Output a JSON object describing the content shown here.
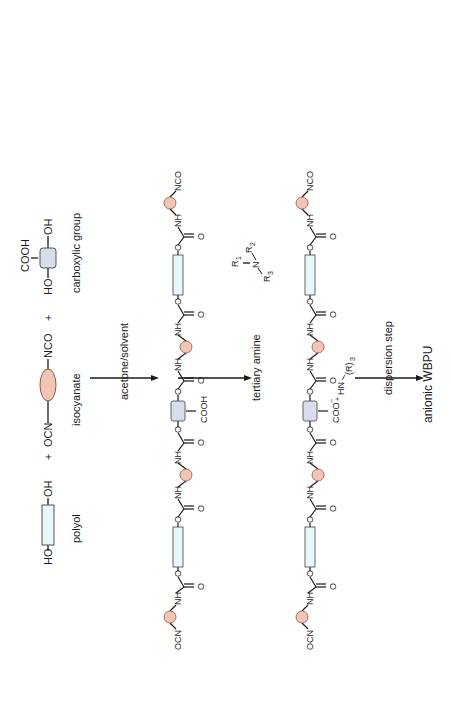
{
  "reactants": {
    "polyol": {
      "left": "HO",
      "right": "OH",
      "label": "polyol"
    },
    "plus1": "+",
    "isocyanate": {
      "left": "OCN",
      "right": "NCO",
      "label": "isocyanate"
    },
    "plus2": "+",
    "carboxylic": {
      "left": "HO",
      "right": "OH",
      "top": "COOH",
      "label": "carboxylic group"
    }
  },
  "steps": [
    {
      "label": "acetone/solvent"
    },
    {
      "label": "tertiary amine",
      "amine": {
        "r1": "R",
        "r1_sub": "1",
        "n": "N",
        "r2": "R",
        "r2_sub": "2",
        "r3": "R",
        "r3_sub": "3"
      }
    },
    {
      "label": "dispersion step"
    }
  ],
  "prepolymer": {
    "end_left": "OCN",
    "end_right": "NCO",
    "nh": "NH",
    "o": "O",
    "pendant": "COOH"
  },
  "neutralized": {
    "end_left": "OCN",
    "end_right": "NCO",
    "nh": "NH",
    "o": "O",
    "pendant": "COO",
    "pendant_charge": "−",
    "plus": "+",
    "counter_ion": "HN",
    "counter_r": "(R)",
    "counter_sub": "3"
  },
  "product": {
    "label": "anionic WBPU"
  },
  "colors": {
    "isocyanate_fill": "#f2c4b4",
    "isocyanate_stroke": "#8a5a4a",
    "polyol_fill": "#e8f7fa",
    "polyol_stroke": "#555555",
    "carboxylic_fill": "#d9dcea",
    "carboxylic_stroke": "#555555",
    "line": "#1a1a1a"
  }
}
